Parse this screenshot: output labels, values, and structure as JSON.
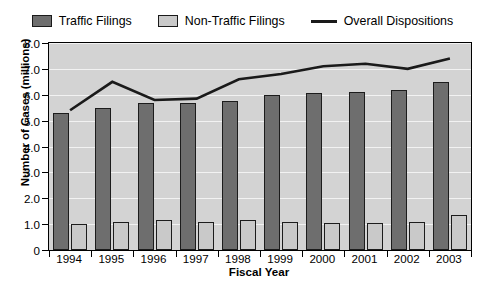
{
  "chart_data": {
    "type": "bar",
    "title": "",
    "xlabel": "Fiscal Year",
    "ylabel": "Number of Cases (millions)",
    "categories": [
      "1994",
      "1995",
      "1996",
      "1997",
      "1998",
      "1999",
      "2000",
      "2001",
      "2002",
      "2003"
    ],
    "ylim": [
      0,
      8.0
    ],
    "yticks": [
      "0",
      "1.0",
      "2.0",
      "3.0",
      "4.0",
      "5.0",
      "6.0",
      "7.0",
      "8.0"
    ],
    "ytick_values": [
      0,
      1.0,
      2.0,
      3.0,
      4.0,
      5.0,
      6.0,
      7.0,
      8.0
    ],
    "grid": true,
    "legend_position": "top",
    "series": [
      {
        "name": "Traffic Filings",
        "type": "bar",
        "color": "#6e6e6e",
        "values": [
          5.3,
          5.5,
          5.7,
          5.7,
          5.75,
          6.0,
          6.05,
          6.1,
          6.2,
          6.5
        ]
      },
      {
        "name": "Non-Traffic Filings",
        "type": "bar",
        "color": "#c9c9c9",
        "values": [
          1.0,
          1.1,
          1.15,
          1.1,
          1.15,
          1.1,
          1.05,
          1.05,
          1.1,
          1.35
        ]
      },
      {
        "name": "Overall Dispositions",
        "type": "line",
        "color": "#1a1a1a",
        "values": [
          5.4,
          6.5,
          5.8,
          5.85,
          6.6,
          6.8,
          7.1,
          7.2,
          7.0,
          7.4
        ]
      }
    ]
  },
  "legend": {
    "items": [
      {
        "label": "Traffic Filings",
        "marker": "square-dark"
      },
      {
        "label": "Non-Traffic Filings",
        "marker": "square-light"
      },
      {
        "label": "Overall Dispositions",
        "marker": "line"
      }
    ]
  },
  "colors": {
    "traffic_bar": "#6e6e6e",
    "nontraffic_bar": "#c9c9c9",
    "line": "#1a1a1a",
    "plot_background": "#d3d3d3",
    "gridline": "#f2f2f2",
    "axis": "#000000",
    "page_background": "#ffffff"
  }
}
